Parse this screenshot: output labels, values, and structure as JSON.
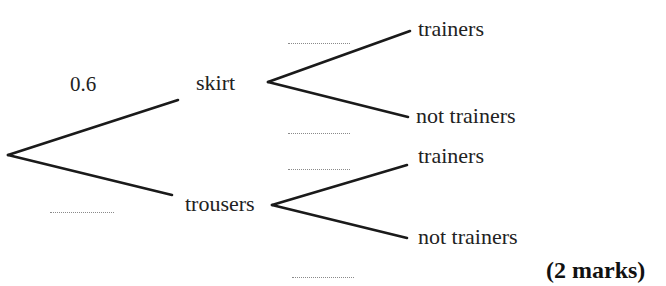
{
  "diagram": {
    "type": "probability-tree",
    "first_stage": {
      "branches": [
        {
          "outcome": "skirt",
          "probability": "0.6"
        },
        {
          "outcome": "trousers",
          "probability": ""
        }
      ]
    },
    "second_stage": {
      "skirt": [
        {
          "outcome": "trainers",
          "probability": ""
        },
        {
          "outcome": "not trainers",
          "probability": ""
        }
      ],
      "trousers": [
        {
          "outcome": "trainers",
          "probability": ""
        },
        {
          "outcome": "not trainers",
          "probability": ""
        }
      ]
    },
    "labels": {
      "skirt": "skirt",
      "trousers": "trousers",
      "skirt_trainers": "trainers",
      "skirt_not_trainers": "not trainers",
      "trousers_trainers": "trainers",
      "trousers_not_trainers": "not trainers",
      "skirt_prob": "0.6"
    },
    "marks": "(2 marks)"
  }
}
